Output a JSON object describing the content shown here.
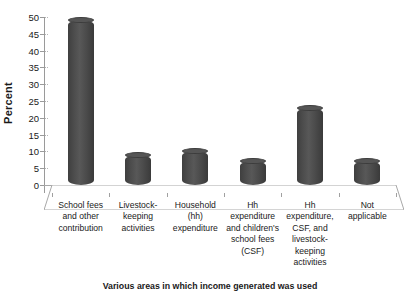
{
  "chart_data": {
    "type": "bar",
    "title": "",
    "xlabel": "Various areas in which income generated  was used",
    "ylabel": "Percent",
    "ylim": [
      0,
      50
    ],
    "ytick_step": 5,
    "yticks": [
      0,
      5,
      10,
      15,
      20,
      25,
      30,
      35,
      40,
      45,
      50
    ],
    "grid": false,
    "legend": "none",
    "style": "3d-cylinder",
    "bar_color": "#4a4a4a",
    "categories": [
      "School fees and other contribution",
      "Livestock-keeping activities",
      "Household (hh) expenditure",
      "Hh expenditure and children's school fees (CSF)",
      "Hh expenditure, CSF, and livestock-keeping activities",
      "Not applicable"
    ],
    "category_lines": [
      [
        "School fees",
        "and other",
        "contribution"
      ],
      [
        "Livestock-",
        "keeping",
        "activities"
      ],
      [
        "Household",
        "(hh)",
        "expenditure"
      ],
      [
        "Hh",
        "expenditure",
        "and children's",
        "school fees",
        "(CSF)"
      ],
      [
        "Hh",
        "expenditure,",
        "CSF, and",
        "livestock-",
        "keeping",
        "activities"
      ],
      [
        "Not",
        "applicable"
      ]
    ],
    "values": [
      49,
      9,
      10,
      7,
      23,
      7
    ]
  }
}
